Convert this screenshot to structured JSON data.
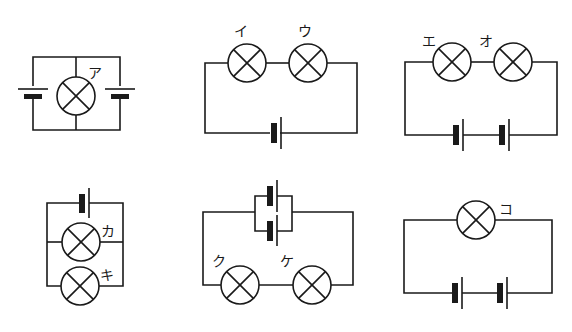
{
  "circuits": [
    {
      "id": "circuit-1",
      "description": "two batteries in parallel with one bulb",
      "bulbs": [
        {
          "label": "ア"
        }
      ],
      "batteries": 2,
      "battery_connection": "parallel"
    },
    {
      "id": "circuit-2",
      "description": "two bulbs in series with one battery",
      "bulbs": [
        {
          "label": "イ"
        },
        {
          "label": "ウ"
        }
      ],
      "batteries": 1,
      "bulb_connection": "series"
    },
    {
      "id": "circuit-3",
      "description": "two bulbs in series with two batteries in series",
      "bulbs": [
        {
          "label": "エ"
        },
        {
          "label": "オ"
        }
      ],
      "batteries": 2,
      "battery_connection": "series",
      "bulb_connection": "series"
    },
    {
      "id": "circuit-4",
      "description": "two bulbs in parallel with one battery",
      "bulbs": [
        {
          "label": "カ"
        },
        {
          "label": "キ"
        }
      ],
      "batteries": 1,
      "bulb_connection": "parallel"
    },
    {
      "id": "circuit-5",
      "description": "two bulbs in series with two batteries in parallel",
      "bulbs": [
        {
          "label": "ク"
        },
        {
          "label": "ケ"
        }
      ],
      "batteries": 2,
      "battery_connection": "parallel",
      "bulb_connection": "series"
    },
    {
      "id": "circuit-6",
      "description": "one bulb with two batteries in series",
      "bulbs": [
        {
          "label": "コ"
        }
      ],
      "batteries": 2,
      "battery_connection": "series"
    }
  ],
  "labels": {
    "a": "ア",
    "i": "イ",
    "u": "ウ",
    "e": "エ",
    "o": "オ",
    "ka": "カ",
    "ki": "キ",
    "ku": "ク",
    "ke": "ケ",
    "ko": "コ"
  },
  "colors": {
    "line": "#1a1a1a",
    "background": "#ffffff"
  }
}
